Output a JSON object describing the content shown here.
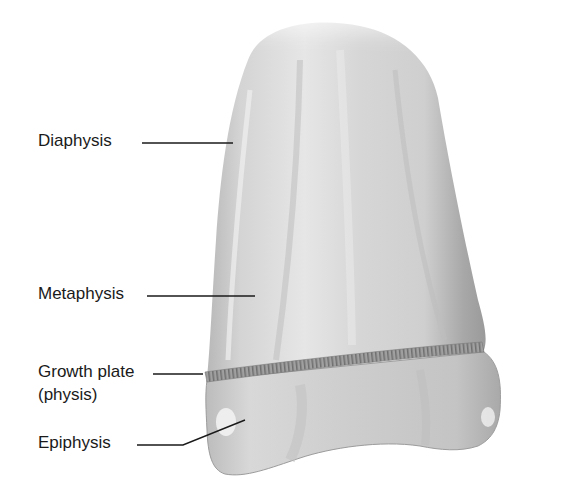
{
  "figure": {
    "colors": {
      "bone_light": "#e4e4e4",
      "bone_mid": "#c9c9c9",
      "bone_dark": "#9a9a9a",
      "growth_plate": "#8a8a8a",
      "leader_line": "#1a1a1a",
      "label_text": "#1a1a1a",
      "background": "#ffffff"
    },
    "labels": [
      {
        "id": "diaphysis",
        "text": "Diaphysis"
      },
      {
        "id": "metaphysis",
        "text": "Metaphysis"
      },
      {
        "id": "growth-plate",
        "text": "Growth plate",
        "subtext": "(physis)"
      },
      {
        "id": "epiphysis",
        "text": "Epiphysis"
      }
    ]
  }
}
